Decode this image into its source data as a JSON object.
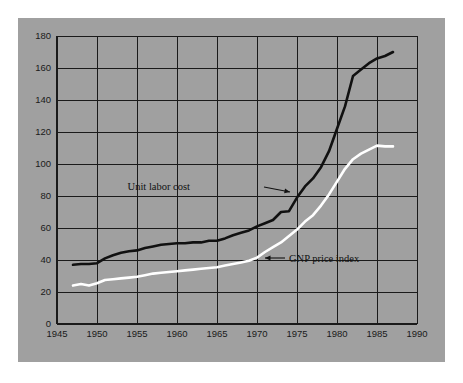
{
  "chart_data": {
    "type": "line",
    "title": "",
    "subtitle": "",
    "xlabel": "",
    "ylabel": "",
    "xlim": [
      1945,
      1990
    ],
    "ylim": [
      0,
      180
    ],
    "xticks": [
      1945,
      1950,
      1955,
      1960,
      1965,
      1970,
      1975,
      1980,
      1985,
      1990
    ],
    "yticks": [
      0,
      20,
      40,
      60,
      80,
      100,
      120,
      140,
      160,
      180
    ],
    "grid": true,
    "legend_position": "inline-annotations",
    "background_color": "#a0a0a0",
    "axis_color": "#1a1a1a",
    "series": [
      {
        "name": "Unit labor cost",
        "color": "#111111",
        "line_width": 2.6,
        "x": [
          1947,
          1948,
          1949,
          1950,
          1951,
          1952,
          1953,
          1954,
          1955,
          1956,
          1957,
          1958,
          1959,
          1960,
          1961,
          1962,
          1963,
          1964,
          1965,
          1966,
          1967,
          1968,
          1969,
          1970,
          1971,
          1972,
          1973,
          1974,
          1975,
          1976,
          1977,
          1978,
          1979,
          1980,
          1981,
          1982,
          1983,
          1984,
          1985,
          1986,
          1987
        ],
        "values": [
          37,
          37.5,
          37.5,
          38,
          41,
          43,
          44.5,
          45.5,
          46,
          47.5,
          48.5,
          49.5,
          50,
          50.5,
          50.5,
          51,
          51,
          52,
          52,
          53.5,
          55.5,
          57,
          58.5,
          61,
          63,
          65,
          70,
          70.5,
          79,
          86,
          91,
          98,
          108,
          122,
          136,
          155,
          159,
          163,
          166,
          167.5,
          170
        ]
      },
      {
        "name": "GNP price index",
        "color": "#ffffff",
        "line_width": 2.6,
        "x": [
          1947,
          1948,
          1949,
          1950,
          1951,
          1952,
          1953,
          1954,
          1955,
          1956,
          1957,
          1958,
          1959,
          1960,
          1961,
          1962,
          1963,
          1964,
          1965,
          1966,
          1967,
          1968,
          1969,
          1970,
          1971,
          1972,
          1973,
          1974,
          1975,
          1976,
          1977,
          1978,
          1979,
          1980,
          1981,
          1982,
          1983,
          1984,
          1985,
          1986,
          1987
        ],
        "values": [
          24,
          25,
          24,
          25.5,
          27.5,
          28,
          28.5,
          29,
          29.5,
          30.5,
          31.5,
          32,
          32.5,
          33,
          33.5,
          34,
          34.5,
          35,
          35.5,
          36.5,
          37.5,
          38.5,
          39.5,
          41.5,
          45,
          48,
          51,
          55,
          59,
          64,
          68,
          74,
          81,
          89,
          97,
          103,
          106.5,
          109,
          111.5,
          111,
          111
        ]
      }
    ],
    "annotations": [
      {
        "text": "Unit labor cost",
        "series": "Unit labor cost",
        "arrow": "right",
        "text_x": 190,
        "text_y": 190,
        "arrow_from_x": 264,
        "arrow_from_y": 187,
        "arrow_to_x": 290,
        "arrow_to_y": 192
      },
      {
        "text": "GNP price index",
        "series": "GNP price index",
        "arrow": "left",
        "text_x": 289,
        "text_y": 262,
        "arrow_from_x": 285,
        "arrow_from_y": 258,
        "arrow_to_x": 265,
        "arrow_to_y": 258
      }
    ]
  },
  "figure": {
    "panel_color": "#a0a0a0",
    "outer_color": "#ffffff"
  }
}
